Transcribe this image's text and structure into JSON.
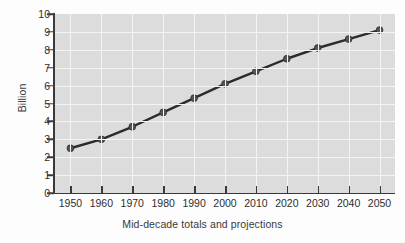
{
  "chart_data": {
    "type": "line",
    "title": "",
    "subtitle": "",
    "xlabel": "Mid-decade totals and projections",
    "ylabel": "Billion",
    "categories": [
      "1950",
      "1960",
      "1970",
      "1980",
      "1990",
      "2000",
      "2010",
      "2020",
      "2030",
      "2040",
      "2050"
    ],
    "x": [
      1950,
      1960,
      1970,
      1980,
      1990,
      2000,
      2010,
      2020,
      2030,
      2040,
      2050
    ],
    "values": [
      2.5,
      3.0,
      3.7,
      4.5,
      5.3,
      6.1,
      6.8,
      7.5,
      8.1,
      8.6,
      9.1
    ],
    "series": [
      {
        "name": "World population",
        "values": [
          2.5,
          3.0,
          3.7,
          4.5,
          5.3,
          6.1,
          6.8,
          7.5,
          8.1,
          8.6,
          9.1
        ]
      }
    ],
    "xlim": [
      1945,
      2055
    ],
    "ylim": [
      0,
      10
    ],
    "ytick_labels": [
      "0",
      "1",
      "2",
      "3",
      "4",
      "5",
      "6",
      "7",
      "8",
      "9",
      "10"
    ],
    "ytick_values": [
      0,
      1,
      2,
      3,
      4,
      5,
      6,
      7,
      8,
      9,
      10
    ],
    "xtick_labels": [
      "1950",
      "1960",
      "1970",
      "1980",
      "1990",
      "2000",
      "2010",
      "2020",
      "2030",
      "2040",
      "2050"
    ],
    "grid": true,
    "grid_color": "#f4f4f4",
    "legend": false,
    "legend_position": "none",
    "marker": "circle",
    "line_color": "#2b2b2b",
    "marker_color": "#555555",
    "plot_background": "#dcdcdc",
    "figure_background": "#fdfdfd",
    "axis_color": "#3a3a3a",
    "annotations": []
  }
}
